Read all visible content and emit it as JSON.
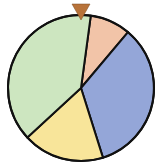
{
  "chart_data": {
    "type": "pie",
    "title": "",
    "start_angle_deg": 7.7,
    "direction": "clockwise",
    "slices": [
      {
        "name": "peach",
        "value": 9,
        "color": "#f2c4a8"
      },
      {
        "name": "blue",
        "value": 34,
        "color": "#94a6d8"
      },
      {
        "name": "yellow",
        "value": 18,
        "color": "#f8e59a"
      },
      {
        "name": "green",
        "value": 39,
        "color": "#cde6c0"
      }
    ]
  },
  "wheel": {
    "center": [
      81,
      88
    ],
    "radius": 73,
    "outline_color": "#111111",
    "pointer_color": "#b8733a"
  }
}
